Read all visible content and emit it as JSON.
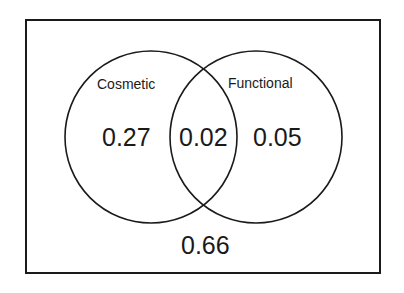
{
  "diagram": {
    "type": "venn",
    "sets": [
      {
        "label": "Cosmetic",
        "only_value": "0.27"
      },
      {
        "label": "Functional",
        "only_value": "0.05"
      }
    ],
    "intersection_value": "0.02",
    "outside_value": "0.66",
    "colors": {
      "stroke": "#1a1a1a",
      "background": "#ffffff"
    }
  }
}
